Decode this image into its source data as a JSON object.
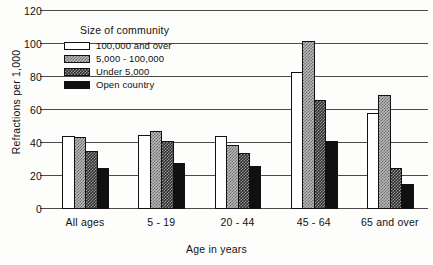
{
  "chart_data": {
    "type": "bar",
    "title": "",
    "xlabel": "Age in years",
    "ylabel": "Refractions per 1,000",
    "ylim": [
      0,
      120
    ],
    "yticks": [
      0,
      20,
      40,
      60,
      80,
      100,
      120
    ],
    "grid": true,
    "legend_position": "inside-upper-left",
    "legend_title": "Size of community",
    "categories": [
      "All ages",
      "5 - 19",
      "20 - 44",
      "45 - 64",
      "65 and over"
    ],
    "series": [
      {
        "name": "100,000 and over",
        "swatch": "white-outline",
        "color": "#ffffff",
        "values": [
          44,
          45,
          44,
          83,
          58
        ]
      },
      {
        "name": "5,000 - 100,000",
        "swatch": "light-checkered",
        "color": "#b9b9b9",
        "values": [
          43.5,
          47,
          38.5,
          102,
          69
        ]
      },
      {
        "name": "Under 5,000",
        "swatch": "dark-checkered",
        "color": "#3a3a3a",
        "values": [
          35,
          41,
          34,
          66,
          25
        ]
      },
      {
        "name": "Open country",
        "swatch": "solid-black",
        "color": "#101010",
        "values": [
          25,
          28,
          26,
          41,
          15
        ]
      }
    ]
  },
  "axis": {
    "ytick_labels": [
      "120",
      "100",
      "80",
      "60",
      "40",
      "20",
      "0"
    ],
    "ylabel": "Refractions per 1,000",
    "xlabel": "Age in years"
  },
  "legend": {
    "title": "Size of community",
    "items": [
      {
        "label": "100,000 and over"
      },
      {
        "label": "5,000 - 100,000"
      },
      {
        "label": "Under 5,000"
      },
      {
        "label": "Open country"
      }
    ]
  }
}
